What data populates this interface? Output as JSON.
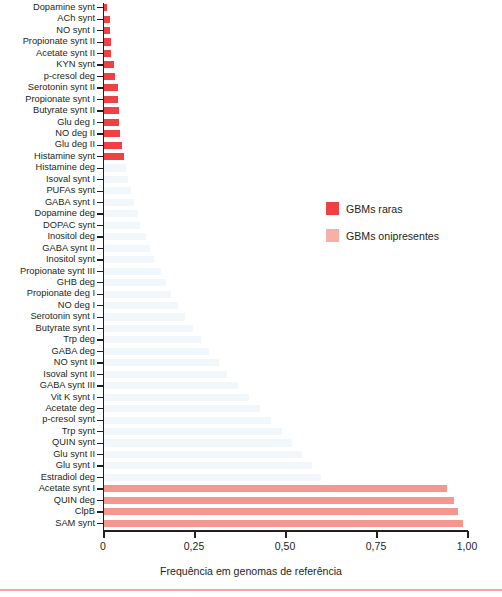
{
  "chart_data": {
    "type": "bar",
    "orientation": "horizontal",
    "title": "",
    "xlabel": "Frequência em genomas de referência",
    "ylabel": "",
    "xlim": [
      0,
      1.0
    ],
    "xticks": [
      0,
      0.25,
      0.5,
      0.75,
      1.0
    ],
    "xticklabels": [
      "0",
      "0,25",
      "0,50",
      "0,75",
      "1,00"
    ],
    "grid": false,
    "decimal_separator": ",",
    "legend_position": "center-right",
    "legend": [
      {
        "label": "GBMs raras",
        "color": "#ef4044"
      },
      {
        "label": "GBMs onipresentes",
        "color": "#f7b0a8"
      }
    ],
    "categories": [
      "Dopamine synt",
      "ACh synt",
      "NO synt I",
      "Propionate synt II",
      "Acetate synt II",
      "KYN synt",
      "p-cresol deg",
      "Serotonin synt II",
      "Propionate synt I",
      "Butyrate synt II",
      "Glu deg I",
      "NO deg II",
      "Glu deg II",
      "Histamine synt",
      "Histamine deg",
      "Isoval synt I",
      "PUFAs synt",
      "GABA synt I",
      "Dopamine deg",
      "DOPAC synt",
      "Inositol deg",
      "GABA synt II",
      "Inositol synt",
      "Propionate synt III",
      "GHB deg",
      "Propionate deg I",
      "NO deg I",
      "Serotonin synt I",
      "Butyrate synt I",
      "Trp deg",
      "GABA deg",
      "NO synt II",
      "Isoval synt II",
      "GABA synt III",
      "Vit K synt I",
      "Acetate deg",
      "p-cresol synt",
      "Trp synt",
      "QUIN synt",
      "Glu synt II",
      "Glu synt I",
      "Estradiol deg",
      "Acetate synt I",
      "QUIN deg",
      "ClpB",
      "SAM synt"
    ],
    "values": [
      0.012,
      0.018,
      0.019,
      0.021,
      0.022,
      0.03,
      0.033,
      0.041,
      0.041,
      0.043,
      0.045,
      0.047,
      0.052,
      0.057,
      0.062,
      0.07,
      0.078,
      0.086,
      0.095,
      0.103,
      0.118,
      0.128,
      0.14,
      0.158,
      0.172,
      0.186,
      0.205,
      0.225,
      0.248,
      0.268,
      0.292,
      0.318,
      0.342,
      0.372,
      0.4,
      0.43,
      0.462,
      0.492,
      0.52,
      0.548,
      0.575,
      0.6,
      0.945,
      0.965,
      0.975,
      0.99
    ],
    "groups": [
      "rara",
      "rara",
      "rara",
      "rara",
      "rara",
      "rara",
      "rara",
      "rara",
      "rara",
      "rara",
      "rara",
      "rara",
      "rara",
      "rara",
      "faint",
      "faint",
      "faint",
      "faint",
      "faint",
      "faint",
      "faint",
      "faint",
      "faint",
      "faint",
      "faint",
      "faint",
      "faint",
      "faint",
      "faint",
      "faint",
      "faint",
      "faint",
      "faint",
      "faint",
      "faint",
      "faint",
      "faint",
      "faint",
      "faint",
      "faint",
      "faint",
      "faint",
      "onipresente",
      "onipresente",
      "onipresente",
      "onipresente"
    ],
    "bar_colors": {
      "rara": "#ef4044",
      "onipresente": "#f4978f",
      "faint": "#f2f7fb"
    }
  },
  "axis": {
    "x_title": "Frequência em genomas de referência",
    "tick_labels": [
      "0",
      "0,25",
      "0,50",
      "0,75",
      "1,00"
    ]
  },
  "legend": {
    "items": [
      {
        "label": "GBMs raras"
      },
      {
        "label": "GBMs onipresentes"
      }
    ]
  }
}
